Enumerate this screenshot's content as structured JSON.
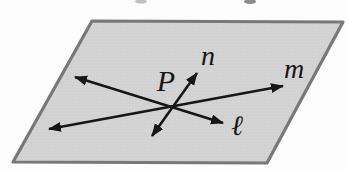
{
  "page": {
    "background": "#fdfdfd"
  },
  "figure": {
    "type": "geometry-diagram",
    "plane": {
      "corners": [
        [
          92,
          21
        ],
        [
          343,
          22
        ],
        [
          267,
          163
        ],
        [
          13,
          162
        ]
      ],
      "fill_color": "#d4d4d4",
      "texture_dot_color": "#c6c6c6",
      "border_color": "#787878",
      "border_width": 3.2
    },
    "ink_color": "#161616",
    "line_width": 2.6,
    "lines": [
      {
        "label": "m",
        "x1": 49,
        "y1": 129,
        "x2": 283,
        "y2": 86,
        "label_x": 294,
        "label_y": 78
      },
      {
        "label": "ℓ",
        "x1": 75,
        "y1": 77,
        "x2": 223,
        "y2": 123,
        "label_x": 237,
        "label_y": 135
      },
      {
        "label": "n",
        "x1": 152,
        "y1": 136,
        "x2": 197,
        "y2": 73,
        "label_x": 208,
        "label_y": 65
      }
    ],
    "point": {
      "label": "P",
      "x": 166,
      "y": 91
    },
    "artifacts": [
      {
        "cx": 141,
        "cy": 1.5,
        "rx": 6,
        "ry": 2,
        "color": "#c2c2c2"
      },
      {
        "cx": 250,
        "cy": 1.5,
        "rx": 6,
        "ry": 2.5,
        "color": "#8a8a8a"
      }
    ]
  }
}
